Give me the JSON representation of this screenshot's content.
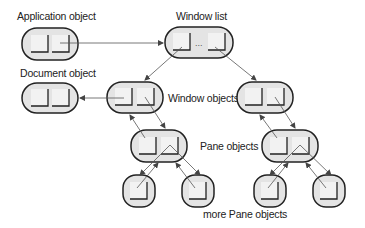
{
  "labels": {
    "application": "Application object",
    "window_list": "Window list",
    "document": "Document object",
    "window_objects": "Window objects",
    "pane_objects": "Pane objects",
    "more_pane_objects": "more Pane objects",
    "ellipsis": "..."
  },
  "colors": {
    "box_fill": "#e4e4e4",
    "box_stroke": "#222222",
    "cell_fill": "#f2f2f2",
    "arrow": "#555555"
  }
}
